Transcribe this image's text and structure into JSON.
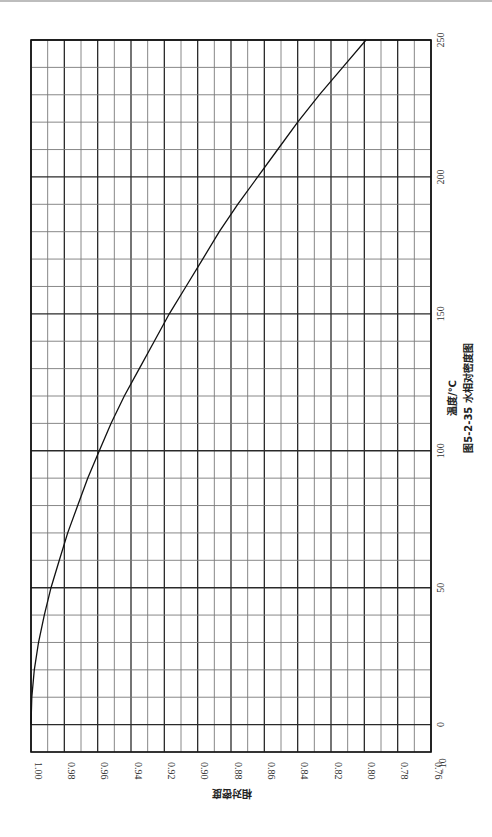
{
  "chart_data": {
    "type": "line",
    "orientation": "rotated 90deg (page printed sideways)",
    "title": "图5-2-35  水相对密度图",
    "xlabel": "温度/℃",
    "ylabel": "相对密度",
    "x_ticks": [
      -10,
      0,
      50,
      100,
      150,
      200,
      250
    ],
    "y_ticks": [
      1.0,
      0.98,
      0.96,
      0.94,
      0.92,
      0.9,
      0.88,
      0.86,
      0.84,
      0.82,
      0.8,
      0.78,
      0.76
    ],
    "xlim": [
      -10,
      250
    ],
    "ylim": [
      0.76,
      1.0
    ],
    "grid": true,
    "grid_minor_x_step": 10,
    "grid_minor_y_step": 0.01,
    "series": [
      {
        "name": "水相对密度",
        "x": [
          0,
          10,
          20,
          30,
          40,
          50,
          60,
          70,
          80,
          90,
          100,
          110,
          120,
          130,
          140,
          150,
          160,
          170,
          180,
          190,
          200,
          210,
          220,
          230,
          240,
          250
        ],
        "values": [
          1.0,
          0.9995,
          0.998,
          0.9955,
          0.992,
          0.988,
          0.983,
          0.978,
          0.972,
          0.966,
          0.959,
          0.952,
          0.944,
          0.935,
          0.926,
          0.917,
          0.907,
          0.897,
          0.887,
          0.876,
          0.864,
          0.852,
          0.84,
          0.827,
          0.813,
          0.799
        ]
      }
    ]
  },
  "labels": {
    "x_axis_title": "温度/℃",
    "y_axis_title": "相对密度",
    "figure_caption": "图5-2-35  水相对密度图"
  },
  "colors": {
    "grid_major": "#2a2a2a",
    "grid_minor": "#7a7a7a",
    "curve": "#111111",
    "frame": "#111111"
  }
}
